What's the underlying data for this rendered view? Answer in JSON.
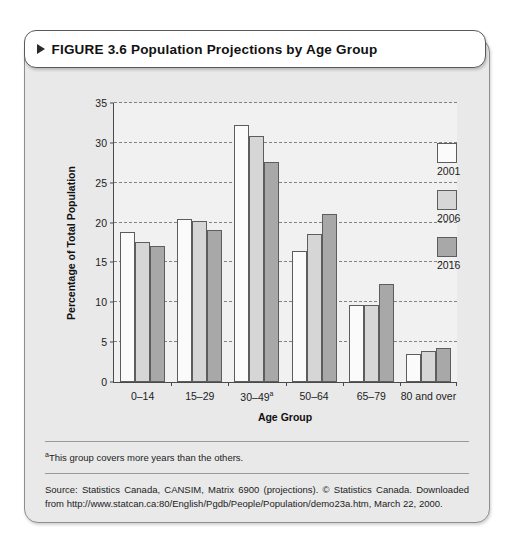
{
  "figure": {
    "marker_icon": "triangle-right-icon",
    "title": "FIGURE 3.6 Population Projections by Age Group"
  },
  "notes": {
    "footnote_marker": "a",
    "footnote_text": "This group covers more years than the others.",
    "source": "Source: Statistics Canada, CANSIM, Matrix 6900 (projections). © Statistics Canada. Downloaded from http://www.statcan.ca:80/English/Pgdb/People/Population/demo23a.htm, March 22, 2000."
  },
  "colors": {
    "series_2001": "#fbfbfb",
    "series_2006": "#d6d6d6",
    "series_2016": "#a8a8a8",
    "card_background": "#e9e9e9",
    "plot_background": "#f1f1f1",
    "axis": "#4a4a4a"
  },
  "chart_data": {
    "type": "bar",
    "title": "Population Projections by Age Group",
    "xlabel": "Age Group",
    "ylabel": "Percentage of Total Population",
    "categories": [
      "0–14",
      "15–29",
      "30–49",
      "50–64",
      "65–79",
      "80 and over"
    ],
    "category_footnotes": [
      "",
      "",
      "a",
      "",
      "",
      ""
    ],
    "series": [
      {
        "name": "2001",
        "values": [
          18.8,
          20.4,
          32.3,
          16.4,
          9.6,
          3.5
        ]
      },
      {
        "name": "2006",
        "values": [
          17.6,
          20.2,
          30.9,
          18.6,
          9.7,
          3.9
        ]
      },
      {
        "name": "2016",
        "values": [
          17.1,
          19.1,
          27.6,
          21.1,
          12.3,
          4.3
        ]
      }
    ],
    "ylim": [
      0,
      35
    ],
    "yticks": [
      0,
      5,
      10,
      15,
      20,
      25,
      30,
      35
    ],
    "grid": true,
    "legend_position": "right"
  }
}
